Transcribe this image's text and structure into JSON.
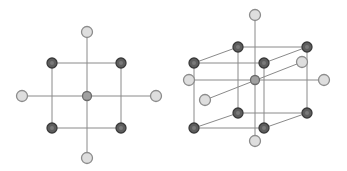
{
  "figures": [
    {
      "name": "planar-octahedral-projection",
      "edges": [
        [
          52,
          63,
          121,
          63
        ],
        [
          52,
          128,
          121,
          128
        ],
        [
          52,
          63,
          52,
          128
        ],
        [
          121,
          63,
          121,
          128
        ],
        [
          87,
          33,
          87,
          157
        ],
        [
          23,
          96,
          155,
          96
        ]
      ],
      "nodes": [
        {
          "x": 87,
          "y": 32,
          "type": "light"
        },
        {
          "x": 52,
          "y": 63,
          "type": "dark"
        },
        {
          "x": 121,
          "y": 63,
          "type": "dark"
        },
        {
          "x": 22,
          "y": 96,
          "type": "light"
        },
        {
          "x": 87,
          "y": 96,
          "type": "mid"
        },
        {
          "x": 156,
          "y": 96,
          "type": "light"
        },
        {
          "x": 52,
          "y": 128,
          "type": "dark"
        },
        {
          "x": 121,
          "y": 128,
          "type": "dark"
        },
        {
          "x": 87,
          "y": 158,
          "type": "light"
        }
      ]
    },
    {
      "name": "3d-cubic-lattice-with-interstitials",
      "edges": [
        [
          238,
          47,
          307,
          47
        ],
        [
          238,
          113,
          307,
          113
        ],
        [
          238,
          47,
          238,
          113
        ],
        [
          307,
          47,
          307,
          113
        ],
        [
          194,
          63,
          264,
          63
        ],
        [
          194,
          128,
          264,
          128
        ],
        [
          194,
          63,
          194,
          128
        ],
        [
          264,
          63,
          264,
          128
        ],
        [
          194,
          63,
          238,
          47
        ],
        [
          264,
          63,
          307,
          47
        ],
        [
          194,
          128,
          238,
          113
        ],
        [
          264,
          128,
          307,
          113
        ],
        [
          255,
          16,
          255,
          140
        ],
        [
          190,
          80,
          323,
          80
        ],
        [
          205,
          100,
          302,
          62
        ]
      ],
      "nodes": [
        {
          "x": 255,
          "y": 15,
          "type": "light"
        },
        {
          "x": 238,
          "y": 47,
          "type": "dark"
        },
        {
          "x": 307,
          "y": 47,
          "type": "dark"
        },
        {
          "x": 302,
          "y": 62,
          "type": "light"
        },
        {
          "x": 194,
          "y": 63,
          "type": "dark"
        },
        {
          "x": 264,
          "y": 63,
          "type": "dark"
        },
        {
          "x": 189,
          "y": 80,
          "type": "light"
        },
        {
          "x": 255,
          "y": 80,
          "type": "mid"
        },
        {
          "x": 324,
          "y": 80,
          "type": "light"
        },
        {
          "x": 205,
          "y": 100,
          "type": "light"
        },
        {
          "x": 238,
          "y": 113,
          "type": "dark"
        },
        {
          "x": 307,
          "y": 113,
          "type": "dark"
        },
        {
          "x": 194,
          "y": 128,
          "type": "dark"
        },
        {
          "x": 264,
          "y": 128,
          "type": "dark"
        },
        {
          "x": 255,
          "y": 141,
          "type": "light"
        }
      ]
    }
  ],
  "colors": {
    "edge": "#8a8a8a",
    "dark_fill": "#5e5e5e",
    "dark_stroke": "#3a3a3a",
    "mid_fill": "#a0a0a0",
    "mid_stroke": "#6a6a6a",
    "light_fill": "#dedede",
    "light_stroke": "#8c8c8c"
  }
}
